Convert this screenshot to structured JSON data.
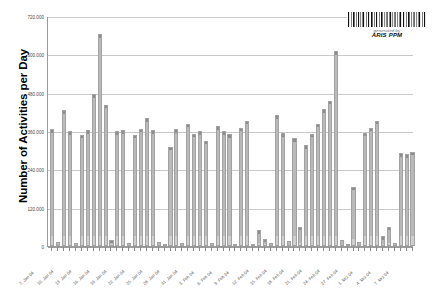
{
  "chart_data": {
    "type": "bar",
    "title": "",
    "xlabel": "",
    "ylabel": "Number of Activities per Day",
    "ylim": [
      0,
      720000
    ],
    "grid": true,
    "legend": "none",
    "y_ticks": [
      0,
      120000,
      240000,
      360000,
      480000,
      600000,
      720000
    ],
    "y_tick_labels": [
      "0",
      "120.000",
      "240.000",
      "360.000",
      "480.000",
      "600.000",
      "720.000"
    ],
    "categories": [
      "7. Jan 04",
      "8. Jan 04",
      "9. Jan 04",
      "10. Jan 04",
      "11. Jan 04",
      "12. Jan 04",
      "13. Jan 04",
      "14. Jan 04",
      "15. Jan 04",
      "16. Jan 04",
      "17. Jan 04",
      "18. Jan 04",
      "19. Jan 04",
      "20. Jan 04",
      "21. Jan 04",
      "22. Jan 04",
      "23. Jan 04",
      "24. Jan 04",
      "25. Jan 04",
      "26. Jan 04",
      "27. Jan 04",
      "28. Jan 04",
      "29. Jan 04",
      "30. Jan 04",
      "31. Jan 04",
      "1. Feb 04",
      "2. Feb 04",
      "3. Feb 04",
      "4. Feb 04",
      "5. Feb 04",
      "6. Feb 04",
      "7. Feb 04",
      "8. Feb 04",
      "9. Feb 04",
      "10. Feb 04",
      "11. Feb 04",
      "12. Feb 04",
      "13. Feb 04",
      "14. Feb 04",
      "15. Feb 04",
      "16. Feb 04",
      "17. Feb 04",
      "18. Feb 04",
      "19. Feb 04",
      "20. Feb 04",
      "21. Feb 04",
      "22. Feb 04",
      "23. Feb 04",
      "24. Feb 04",
      "25. Feb 04",
      "26. Feb 04",
      "27. Feb 04",
      "28. Feb 04",
      "29. Feb 04",
      "1. Mrz 04",
      "2. Mrz 04",
      "3. Mrz 04",
      "4. Mrz 04",
      "5. Mrz 04",
      "6. Mrz 04",
      "7. Mrz 04",
      "8. Mrz 04"
    ],
    "visible_tick_labels": [
      {
        "index": 0,
        "label": "7. Jan 04"
      },
      {
        "index": 3,
        "label": "10. Jan 04"
      },
      {
        "index": 6,
        "label": "13. Jan 04"
      },
      {
        "index": 9,
        "label": "16. Jan 04"
      },
      {
        "index": 12,
        "label": "19. Jan 04"
      },
      {
        "index": 15,
        "label": "22. Jan 04"
      },
      {
        "index": 18,
        "label": "25. Jan 04"
      },
      {
        "index": 21,
        "label": "28. Jan 04"
      },
      {
        "index": 24,
        "label": "31. Jan 04"
      },
      {
        "index": 27,
        "label": "3. Feb 04"
      },
      {
        "index": 30,
        "label": "6. Feb 04"
      },
      {
        "index": 33,
        "label": "9. Feb 04"
      },
      {
        "index": 36,
        "label": "12. Feb 04"
      },
      {
        "index": 39,
        "label": "15. Feb 04"
      },
      {
        "index": 42,
        "label": "18. Feb 04"
      },
      {
        "index": 45,
        "label": "21. Feb 04"
      },
      {
        "index": 48,
        "label": "24. Feb 04"
      },
      {
        "index": 51,
        "label": "27. Feb 04"
      },
      {
        "index": 54,
        "label": "1. Mrz 04"
      },
      {
        "index": 57,
        "label": "4. Mrz 04"
      },
      {
        "index": 60,
        "label": "7. Mrz 04"
      }
    ],
    "values": [
      365000,
      13000,
      425000,
      360000,
      8000,
      348000,
      363000,
      475000,
      663000,
      443000,
      20000,
      360000,
      362000,
      8000,
      348000,
      367000,
      400000,
      362000,
      12000,
      6000,
      310000,
      365000,
      9000,
      383000,
      352000,
      360000,
      330000,
      10000,
      375000,
      360000,
      350000,
      7000,
      370000,
      392000,
      5000,
      50000,
      22000,
      8000,
      410000,
      353000,
      15000,
      337000,
      60000,
      315000,
      352000,
      382000,
      428000,
      455000,
      610000,
      18000,
      6000,
      185000,
      12000,
      355000,
      370000,
      392000,
      30000,
      60000,
      10000,
      290000,
      288000,
      295000
    ],
    "bar_color": "#b9b9b9",
    "bar_edge_color": "#a2a2a2",
    "gridline_color": "#c9c9c9",
    "axis_color": "#9a9a9a",
    "background_color": "#ffffff"
  },
  "watermark": {
    "generated_label": "generated by",
    "brand": "ARIS PPM",
    "barcode_name": "barcode-icon"
  }
}
